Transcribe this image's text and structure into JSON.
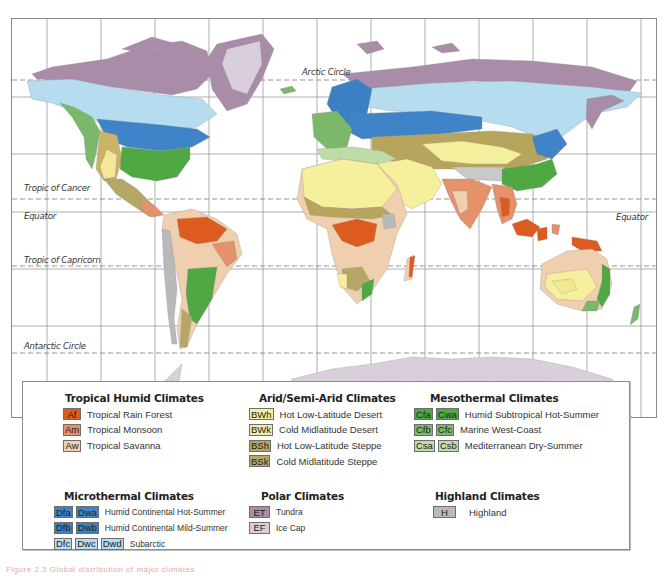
{
  "map": {
    "title": "World Climate Regions (Köppen classification)",
    "latitude_labels": {
      "arctic_circle": "Arctic Circle",
      "tropic_of_cancer": "Tropic of Cancer",
      "equator_left": "Equator",
      "equator_right": "Equator",
      "tropic_of_capricorn": "Tropic of Capricorn",
      "antarctic_circle": "Antarctic Circle"
    },
    "colors": {
      "Af": "#de5b1f",
      "Am": "#e4916c",
      "Aw": "#efcfae",
      "BWh": "#f6ef9c",
      "BWk": "#f2eaa0",
      "BSh": "#b7a55e",
      "BSk": "#b5a866",
      "Cfa": "#4fa844",
      "Cwa": "#4fa844",
      "Cfb": "#7cb86a",
      "Cfc": "#7cb86a",
      "Csa": "#bfdca7",
      "Csb": "#bfdca7",
      "Dfa": "#3f84c8",
      "Dwa": "#3f84c8",
      "Dfb": "#3b7fc4",
      "Dwb": "#3b7fc4",
      "Dfc": "#b6dcef",
      "Dwc": "#b6dcef",
      "Dwd": "#b6dcef",
      "ET": "#a98ca8",
      "EF": "#d9cfdb",
      "H": "#b9b9b9",
      "grid": "#8e8e8e",
      "frame": "#8a8a8a"
    }
  },
  "legend": {
    "tropical": {
      "title": "Tropical Humid Climates",
      "items": [
        {
          "codes": [
            "Af"
          ],
          "label": "Tropical Rain Forest"
        },
        {
          "codes": [
            "Am"
          ],
          "label": "Tropical Monsoon"
        },
        {
          "codes": [
            "Aw"
          ],
          "label": "Tropical Savanna"
        }
      ]
    },
    "arid": {
      "title": "Arid/Semi-Arid Climates",
      "items": [
        {
          "codes": [
            "BWh"
          ],
          "label": "Hot Low-Latitude Desert"
        },
        {
          "codes": [
            "BWk"
          ],
          "label": "Cold Midlatitude Desert"
        },
        {
          "codes": [
            "BSh"
          ],
          "label": "Hot Low-Latitude Steppe"
        },
        {
          "codes": [
            "BSk"
          ],
          "label": "Cold Midlatitude Steppe"
        }
      ]
    },
    "mesothermal": {
      "title": "Mesothermal Climates",
      "items": [
        {
          "codes": [
            "Cfa",
            "Cwa"
          ],
          "label": "Humid Subtropical Hot-Summer"
        },
        {
          "codes": [
            "Cfb",
            "Cfc"
          ],
          "label": "Marine West-Coast"
        },
        {
          "codes": [
            "Csa",
            "Csb"
          ],
          "label": "Mediterranean Dry-Summer"
        }
      ]
    },
    "microthermal": {
      "title": "Microthermal Climates",
      "items": [
        {
          "codes": [
            "Dfa",
            "Dwa"
          ],
          "label": "Humid Continental Hot-Summer"
        },
        {
          "codes": [
            "Dfb",
            "Dwb"
          ],
          "label": "Humid Continental Mild-Summer"
        },
        {
          "codes": [
            "Dfc",
            "Dwc",
            "Dwd"
          ],
          "label": "Subarctic"
        }
      ]
    },
    "polar": {
      "title": "Polar Climates",
      "items": [
        {
          "codes": [
            "ET"
          ],
          "label": "Tundra"
        },
        {
          "codes": [
            "EF"
          ],
          "label": "Ice Cap"
        }
      ]
    },
    "highland": {
      "title": "Highland Climates",
      "items": [
        {
          "codes": [
            "H"
          ],
          "label": "Highland"
        }
      ]
    }
  },
  "caption": "Figure 2.3  Global distribution of major climates"
}
